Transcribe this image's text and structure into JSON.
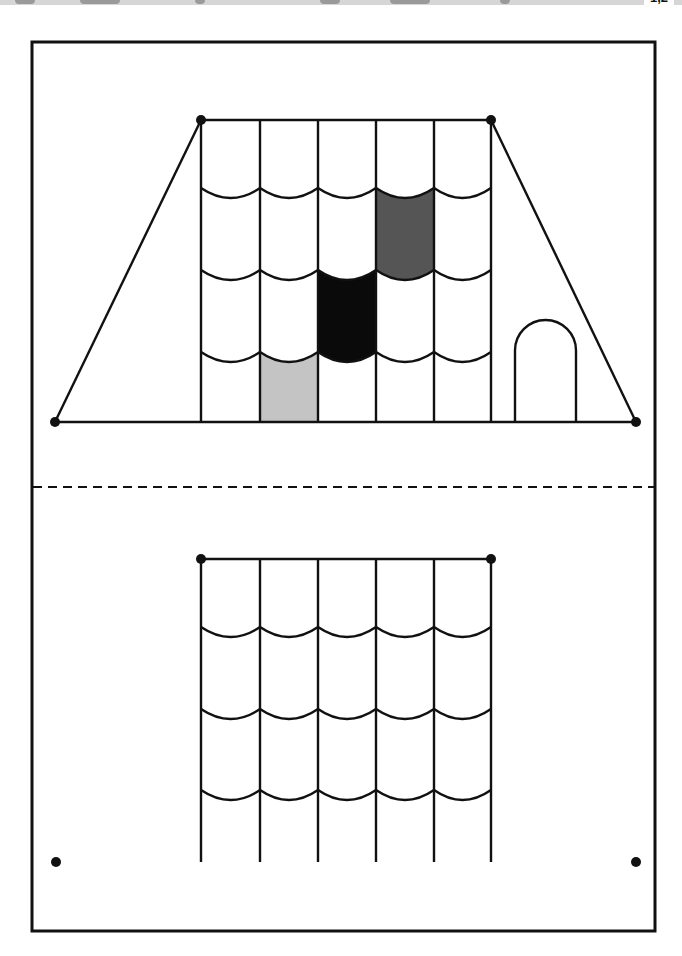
{
  "banner": {
    "label": "1,2",
    "color": "#d6d6d6"
  },
  "worksheet": {
    "frame": {
      "x": 32,
      "y": 42,
      "width": 623,
      "height": 889
    },
    "cut_line_y": 487,
    "colors": {
      "stroke": "#111111",
      "tile_light_gray": "#c4c4c4",
      "tile_black": "#0a0a0a",
      "tile_dark_gray": "#555555",
      "background": "#ffffff"
    },
    "top_roof": {
      "trapezoid": {
        "top_left": [
          201,
          120
        ],
        "top_right": [
          491,
          120
        ],
        "bottom_left": [
          55,
          422
        ],
        "bottom_right": [
          636,
          422
        ]
      },
      "columns_x": [
        201,
        260,
        318,
        376,
        434,
        491
      ],
      "arc_rows_y": [
        188,
        270,
        352
      ],
      "bottom_y": 422,
      "arc_depth": 10,
      "filled_tiles": [
        {
          "column": 1,
          "row": 3,
          "color": "tile_light_gray"
        },
        {
          "column": 2,
          "row": 2,
          "color": "tile_black"
        },
        {
          "column": 3,
          "row": 1,
          "color": "tile_dark_gray"
        }
      ],
      "door": {
        "left": 515,
        "right": 576,
        "top": 320,
        "bottom": 422
      }
    },
    "bottom_roof": {
      "top_y": 559,
      "columns_x": [
        201,
        260,
        318,
        376,
        434,
        491
      ],
      "arc_rows_y": [
        627,
        709,
        790
      ],
      "bottom_y": 862,
      "arc_depth": 10,
      "dots": [
        [
          201,
          559
        ],
        [
          491,
          559
        ],
        [
          56,
          862
        ],
        [
          636,
          862
        ]
      ]
    }
  }
}
